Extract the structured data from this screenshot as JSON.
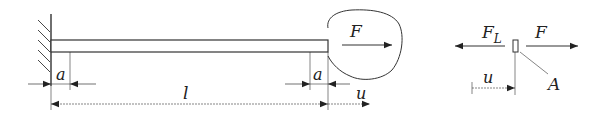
{
  "diagram": {
    "beam": {
      "labels": {
        "force": "F",
        "left_gap": "a",
        "right_gap": "a",
        "length": "l",
        "displacement": "u"
      }
    },
    "free_body": {
      "labels": {
        "reaction_force": "F",
        "reaction_sub": "L",
        "applied_force": "F",
        "displacement": "u",
        "area": "A"
      }
    },
    "colors": {
      "line": "#333333",
      "text": "#222222",
      "background": "#ffffff"
    }
  }
}
